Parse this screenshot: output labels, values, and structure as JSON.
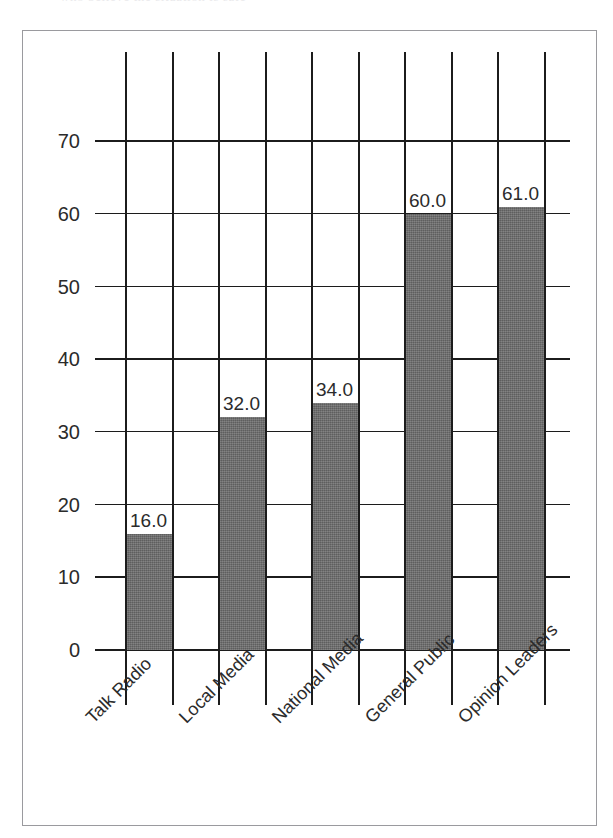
{
  "figure": {
    "top_caption_sliver": "who believe the situation is safe",
    "frame_color": "#9a9a9e",
    "background": "#ffffff"
  },
  "chart_data": {
    "type": "bar",
    "title": "",
    "subtitle": "",
    "xlabel": "",
    "ylabel": "",
    "categories": [
      "Talk Radio",
      "Local Media",
      "National Media",
      "General Public",
      "Opinion Leaders"
    ],
    "values": [
      16.0,
      32.0,
      34.0,
      60.0,
      61.0
    ],
    "value_labels": [
      "16.0",
      "32.0",
      "34.0",
      "60.0",
      "61.0"
    ],
    "ylim": [
      0,
      70
    ],
    "ytick_labels": [
      "0",
      "10",
      "20",
      "30",
      "40",
      "50",
      "60",
      "70"
    ],
    "ytick_values": [
      0,
      10,
      20,
      30,
      40,
      50,
      60,
      70
    ],
    "grid": "vertical-and-horizontal",
    "gridline_color": "#1c1c1c",
    "legend": "none",
    "legend_position": "none",
    "bar_color": "#6b6b6b",
    "bar_fill": "dithered-gray-halftone",
    "xtick_label_rotation": "-45"
  },
  "axis_geometry": {
    "baseline_y": 650,
    "pixels_per_unit": 7.27,
    "grid_x_positions": [
      125,
      172,
      218,
      265,
      311,
      358,
      404,
      451,
      497,
      544
    ],
    "grid_top_y": 52,
    "grid_bottom_y": 705,
    "hline_left_x": 95,
    "hline_right_x": 570
  }
}
